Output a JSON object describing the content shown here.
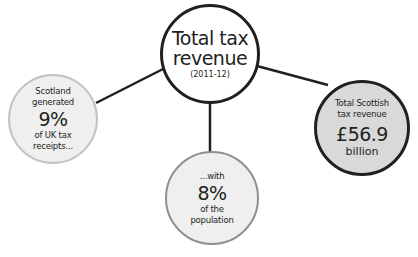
{
  "center": {
    "title_line1": "Total tax",
    "title_line2": "revenue",
    "subtitle": "(2011-12)"
  },
  "left": {
    "line1": "Scotland",
    "line2": "generated",
    "value": "9%",
    "line3": "of UK tax",
    "line4": "receipts..."
  },
  "bottom": {
    "line1": "...with",
    "value": "8%",
    "line2": "of the",
    "line3": "population"
  },
  "right": {
    "line1": "Total Scottish",
    "line2": "tax revenue",
    "value": "£56.9",
    "unit": "billion"
  },
  "colors": {
    "stroke": "#231f20",
    "left_fill": "#efefef",
    "bottom_fill": "#efefef",
    "right_fill": "#d9d9d9"
  }
}
